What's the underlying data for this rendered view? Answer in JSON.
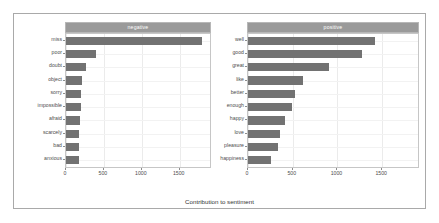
{
  "chart_data": {
    "type": "bar",
    "title": "",
    "xlabel": "Contribution to sentiment",
    "ylabel": "",
    "orientation": "horizontal",
    "xlim": [
      0,
      1900
    ],
    "xticks": [
      0,
      500,
      1000,
      1500
    ],
    "xtick_labels": [
      "0",
      "500",
      "1000",
      "1500"
    ],
    "grid": true,
    "legend": "none",
    "bar_color": "#727272",
    "strip_color": "#9a9a9a",
    "panels": [
      {
        "strip_label": "negative",
        "categories": [
          "miss",
          "poor",
          "doubt",
          "object",
          "sorry",
          "impossible",
          "afraid",
          "scarcely",
          "bad",
          "anxious"
        ],
        "values": [
          1800,
          390,
          260,
          215,
          200,
          200,
          190,
          170,
          170,
          165
        ]
      },
      {
        "strip_label": "positive",
        "categories": [
          "well",
          "good",
          "great",
          "like",
          "better",
          "enough",
          "happy",
          "love",
          "pleasure",
          "happiness"
        ],
        "values": [
          1420,
          1270,
          900,
          610,
          530,
          490,
          415,
          360,
          340,
          255
        ]
      }
    ]
  },
  "axis": {
    "x_title": "Contribution to sentiment"
  }
}
